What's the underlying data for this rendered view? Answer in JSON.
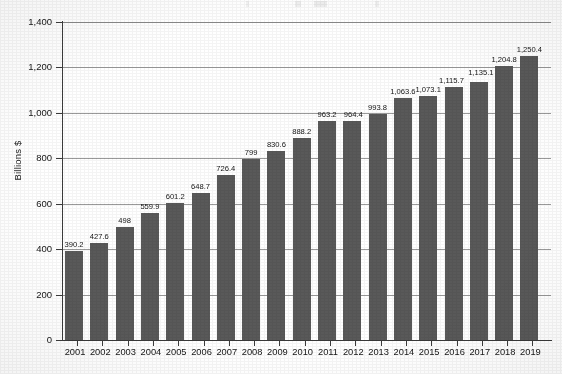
{
  "chart_data": {
    "type": "bar",
    "title": "",
    "subtitle": "",
    "xlabel": "",
    "ylabel": "Billions $",
    "categories": [
      "2001",
      "2002",
      "2003",
      "2004",
      "2005",
      "2006",
      "2007",
      "2008",
      "2009",
      "2010",
      "2011",
      "2012",
      "2013",
      "2014",
      "2015",
      "2016",
      "2017",
      "2018",
      "2019"
    ],
    "values": [
      390.2,
      427.6,
      498,
      559.9,
      601.2,
      648.7,
      726.4,
      799,
      830.6,
      888.2,
      963.2,
      964.4,
      993.8,
      1063.6,
      1073.1,
      1115.7,
      1135.1,
      1204.8,
      1250.4
    ],
    "value_labels": [
      "390.2",
      "427.6",
      "498",
      "559.9",
      "601.2",
      "648.7",
      "726.4",
      "799",
      "830.6",
      "888.2",
      "963.2",
      "964.4",
      "993.8",
      "1,063.6",
      "1,073.1",
      "1,115.7",
      "1,135.1",
      "1,204.8",
      "1,250.4"
    ],
    "ylim": [
      0,
      1400
    ],
    "ytick_values": [
      0,
      200,
      400,
      600,
      800,
      1000,
      1200,
      1400
    ],
    "ytick_labels": [
      "0",
      "200",
      "400",
      "600",
      "800",
      "1,000",
      "1,200",
      "1,400"
    ],
    "grid": "horizontal",
    "legend": "none",
    "series": [
      {
        "name": "Billions $",
        "values": [
          390.2,
          427.6,
          498,
          559.9,
          601.2,
          648.7,
          726.4,
          799,
          830.6,
          888.2,
          963.2,
          964.4,
          993.8,
          1063.6,
          1073.1,
          1115.7,
          1135.1,
          1204.8,
          1250.4
        ]
      }
    ],
    "colors": {
      "bar": "#595959",
      "grid": "#9a9a9a",
      "axis": "#3a3a3a",
      "text": "#151515",
      "background": "#ffffff"
    }
  }
}
